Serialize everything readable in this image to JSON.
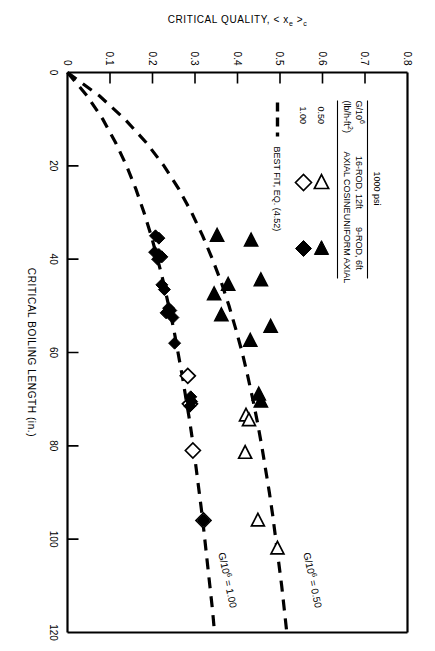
{
  "figure": {
    "background": "#ffffff",
    "ink": "#000000"
  },
  "chart_data": {
    "type": "scatter",
    "title": "",
    "xlabel": "CRITICAL BOILING LENGTH (in.)",
    "ylabel": "CRITICAL QUALITY, < x",
    "ylabel_sub": "e",
    "ylabel_tail": " >",
    "ylabel_sub2": "c",
    "xlim": [
      0,
      120
    ],
    "ylim": [
      0,
      0.8
    ],
    "xticks": [
      0,
      20,
      40,
      60,
      80,
      100,
      120
    ],
    "xtick_labels": [
      "0",
      "20",
      "40",
      "60",
      "80",
      "100",
      "120"
    ],
    "yticks": [
      0,
      0.1,
      0.2,
      0.3,
      0.4,
      0.5,
      0.6,
      0.7,
      0.8
    ],
    "ytick_labels": [
      "0",
      "0.1",
      "0.2",
      "0.3",
      "0.4",
      "0.5",
      "0.6",
      "0.7",
      "0.8"
    ],
    "grid": false,
    "legend_position": "upper-left-inset",
    "annotations": [
      {
        "name": "curve-label-upper",
        "text": "G/10",
        "sup": "6",
        "tail": " = 0.50",
        "x": 103,
        "y": 0.555
      },
      {
        "name": "curve-label-lower",
        "text": "G/10",
        "sup": "6",
        "tail": " = 1.00",
        "x": 103,
        "y": 0.355
      }
    ],
    "series": [
      {
        "name": "16-ROD, 12ft AXIAL COSINE, G/10^6 = 0.50",
        "marker": "open-triangle-left",
        "points": [
          [
            35.0,
            0.352
          ],
          [
            36.0,
            0.432
          ],
          [
            44.5,
            0.455
          ],
          [
            45.5,
            0.378
          ],
          [
            47.5,
            0.345
          ],
          [
            52.0,
            0.362
          ],
          [
            54.5,
            0.478
          ],
          [
            57.5,
            0.43
          ],
          [
            69.0,
            0.45
          ],
          [
            70.5,
            0.455
          ],
          [
            73.5,
            0.42
          ],
          [
            74.5,
            0.427
          ],
          [
            81.5,
            0.418
          ],
          [
            96.0,
            0.448
          ],
          [
            102.0,
            0.494
          ]
        ]
      },
      {
        "name": "9-ROD, 6ft UNIFORM AXIAL, G/10^6 = 0.50",
        "marker": "filled-triangle-left",
        "points": [
          [
            35.0,
            0.352
          ],
          [
            36.0,
            0.432
          ],
          [
            44.5,
            0.455
          ],
          [
            45.5,
            0.378
          ],
          [
            47.5,
            0.345
          ],
          [
            52.0,
            0.362
          ],
          [
            54.5,
            0.478
          ],
          [
            57.5,
            0.43
          ],
          [
            69.0,
            0.45
          ],
          [
            70.5,
            0.455
          ]
        ]
      },
      {
        "name": "16-ROD, 12ft AXIAL COSINE, G/10^6 = 1.00",
        "marker": "open-diamond",
        "points": [
          [
            65.0,
            0.283
          ],
          [
            71.0,
            0.288
          ],
          [
            81.0,
            0.295
          ],
          [
            96.0,
            0.32
          ]
        ]
      },
      {
        "name": "9-ROD, 6ft UNIFORM AXIAL, G/10^6 = 1.00",
        "marker": "filled-diamond",
        "points": [
          [
            35.0,
            0.207
          ],
          [
            35.5,
            0.215
          ],
          [
            38.5,
            0.205
          ],
          [
            39.0,
            0.215
          ],
          [
            39.5,
            0.222
          ],
          [
            40.0,
            0.212
          ],
          [
            45.5,
            0.222
          ],
          [
            46.5,
            0.228
          ],
          [
            50.5,
            0.238
          ],
          [
            51.0,
            0.243
          ],
          [
            51.5,
            0.232
          ],
          [
            52.5,
            0.248
          ],
          [
            58.0,
            0.252
          ],
          [
            69.5,
            0.29
          ],
          [
            70.5,
            0.292
          ],
          [
            71.5,
            0.288
          ],
          [
            96.0,
            0.32
          ]
        ]
      }
    ],
    "fit_curves": [
      {
        "name": "BEST FIT, EQ. (4.52), G/10^6 = 0.50",
        "style": "dashed",
        "points": [
          [
            0,
            0
          ],
          [
            5,
            0.075
          ],
          [
            10,
            0.135
          ],
          [
            15,
            0.185
          ],
          [
            20,
            0.227
          ],
          [
            25,
            0.262
          ],
          [
            30,
            0.292
          ],
          [
            35,
            0.318
          ],
          [
            40,
            0.341
          ],
          [
            45,
            0.362
          ],
          [
            50,
            0.38
          ],
          [
            55,
            0.396
          ],
          [
            60,
            0.411
          ],
          [
            65,
            0.424
          ],
          [
            70,
            0.436
          ],
          [
            75,
            0.447
          ],
          [
            80,
            0.457
          ],
          [
            85,
            0.466
          ],
          [
            90,
            0.475
          ],
          [
            95,
            0.483
          ],
          [
            100,
            0.49
          ],
          [
            105,
            0.497
          ],
          [
            110,
            0.504
          ],
          [
            115,
            0.51
          ],
          [
            120,
            0.516
          ]
        ]
      },
      {
        "name": "BEST FIT, EQ. (4.52), G/10^6 = 1.00",
        "style": "dashed",
        "points": [
          [
            0,
            0
          ],
          [
            5,
            0.046
          ],
          [
            10,
            0.083
          ],
          [
            15,
            0.113
          ],
          [
            20,
            0.139
          ],
          [
            25,
            0.161
          ],
          [
            30,
            0.18
          ],
          [
            35,
            0.197
          ],
          [
            40,
            0.212
          ],
          [
            45,
            0.226
          ],
          [
            50,
            0.238
          ],
          [
            55,
            0.25
          ],
          [
            60,
            0.26
          ],
          [
            65,
            0.27
          ],
          [
            70,
            0.279
          ],
          [
            75,
            0.288
          ],
          [
            80,
            0.296
          ],
          [
            85,
            0.303
          ],
          [
            90,
            0.31
          ],
          [
            95,
            0.317
          ],
          [
            100,
            0.323
          ],
          [
            105,
            0.329
          ],
          [
            110,
            0.335
          ],
          [
            115,
            0.341
          ],
          [
            120,
            0.346
          ]
        ]
      }
    ]
  },
  "legend": {
    "title": "1000 psi",
    "col_headers": [
      "16-ROD, 12ft",
      "9-ROD, 6ft"
    ],
    "col_subheaders": [
      "AXIAL COSINE",
      "UNIFORM AXIAL"
    ],
    "row_header_line1": "G/10",
    "row_header_sup": "6",
    "row_header_line2": "(lb/h-ft",
    "row_header_sup2": "2",
    "row_header_line2b": ")",
    "rows": [
      {
        "label": "0.50",
        "cosine_marker": "open-triangle-left",
        "uniform_marker": "filled-triangle-left"
      },
      {
        "label": "1.00",
        "cosine_marker": "open-diamond",
        "uniform_marker": "filled-diamond"
      }
    ],
    "fit_label": "BEST FIT, EQ. (4.52)",
    "fit_marker": "dashed-line"
  }
}
